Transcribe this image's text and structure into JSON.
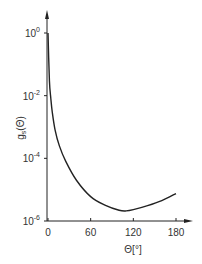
{
  "chart_data": {
    "type": "line",
    "title": "",
    "xlabel": "Θ[°]",
    "ylabel": "g_s(Θ)",
    "yscale": "log",
    "xlim": [
      0,
      180
    ],
    "ylim": [
      1e-06,
      1
    ],
    "x_ticks": [
      "0",
      "60",
      "120",
      "180"
    ],
    "y_ticks": [
      {
        "base": "10",
        "exp": "0"
      },
      {
        "base": "10",
        "exp": "-2"
      },
      {
        "base": "10",
        "exp": "-4"
      },
      {
        "base": "10",
        "exp": "-6"
      }
    ],
    "grid": false,
    "series": [
      {
        "name": "g_s(Θ)",
        "x": [
          0,
          2,
          4,
          6,
          10,
          16,
          25,
          40,
          60,
          80,
          100,
          110,
          120,
          140,
          160,
          180
        ],
        "y": [
          1.0,
          0.03,
          0.008,
          0.003,
          0.0008,
          0.00025,
          8e-05,
          2e-05,
          6e-06,
          3.2e-06,
          2.2e-06,
          2.1e-06,
          2.3e-06,
          3.1e-06,
          4.5e-06,
          7.5e-06
        ]
      }
    ]
  },
  "axes": {
    "y_label_main": "g",
    "y_label_sub": "s",
    "y_label_arg": "(Θ)",
    "x_label": "Θ[°]"
  }
}
